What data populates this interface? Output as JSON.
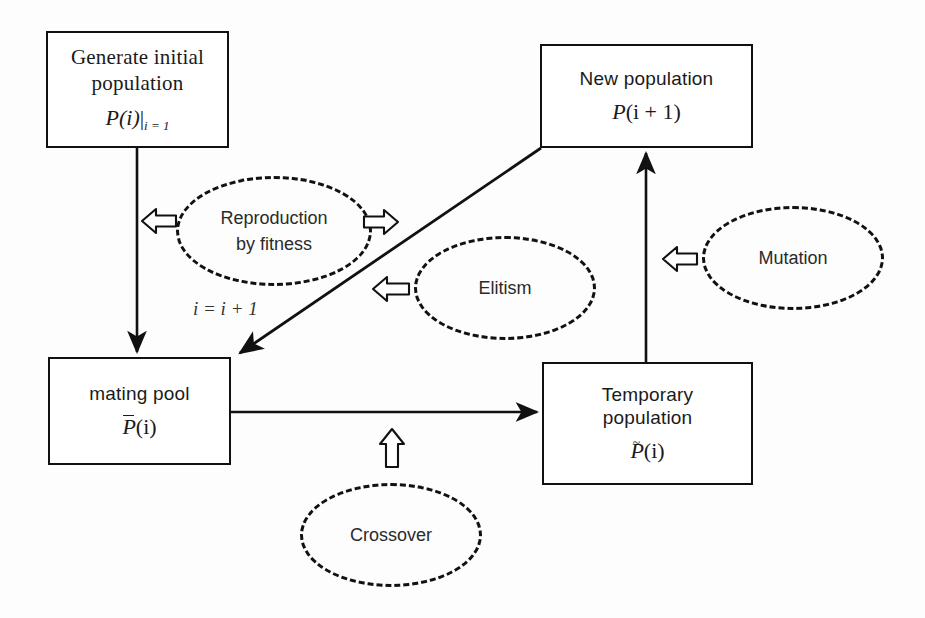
{
  "diagram": {
    "stroke_color": "#111111",
    "text_color": "#1a1a1a",
    "background_color": "#fdfdfd"
  },
  "nodes": {
    "generate_initial": {
      "line1": "Generate initial",
      "line2": "population",
      "math_p": "P",
      "math_arg": "(i)",
      "math_sub": "i = 1"
    },
    "new_population": {
      "line1": "New population",
      "math_p": "P",
      "math_arg": "(i + 1)"
    },
    "mating_pool": {
      "line1": "mating pool",
      "math_p": "P",
      "math_arg": "(i)",
      "accent": "bar"
    },
    "temporary_population": {
      "line1": "Temporary",
      "line2": "population",
      "math_p": "P",
      "math_arg": "(i)",
      "accent": "tilde"
    }
  },
  "bubbles": {
    "reproduction": {
      "line1": "Reproduction",
      "line2": "by fitness"
    },
    "elitism": {
      "line1": "Elitism"
    },
    "mutation": {
      "line1": "Mutation"
    },
    "crossover": {
      "line1": "Crossover"
    }
  },
  "edge_labels": {
    "iteration": "i = i + 1"
  },
  "icons": {
    "arrow_left_reproduction": "arrow-left-outline-icon",
    "arrow_right_reproduction": "arrow-right-outline-icon",
    "arrow_left_elitism": "arrow-left-outline-icon",
    "arrow_left_mutation": "arrow-left-outline-icon",
    "arrow_up_crossover": "arrow-up-outline-icon"
  },
  "connectors": [
    {
      "name": "generate-to-mating-pool",
      "direction": "down"
    },
    {
      "name": "new-population-to-mating-pool",
      "direction": "diagonal-down-left"
    },
    {
      "name": "mating-pool-to-temporary-population",
      "direction": "right"
    },
    {
      "name": "temporary-population-to-new-population",
      "direction": "up"
    }
  ]
}
